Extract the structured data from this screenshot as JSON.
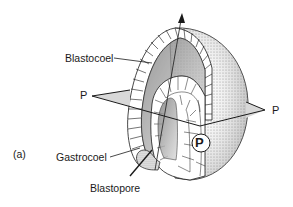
{
  "figure": {
    "panel_label": "(a)",
    "labels": {
      "blastocoel": "Blastocoel",
      "gastrocoel": "Gastrocoel",
      "blastopore": "Blastopore",
      "plane_left": "P",
      "plane_right": "P",
      "circled": "P"
    },
    "colors": {
      "ink": "#1a1a1a",
      "stipple": "#9a9a9a",
      "plane_fill": "#d8d8d8",
      "background": "#ffffff"
    }
  }
}
